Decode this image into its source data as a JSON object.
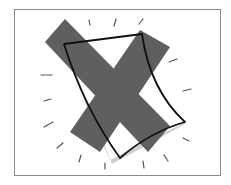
{
  "illustration": {
    "subject": "delete-document",
    "description": "Gray X mark over a curled sheet of paper with radiating tick marks",
    "colors": {
      "frame_border": "#8a8a8a",
      "x_mark": "#5f5f5f",
      "paper_outline": "#111111",
      "paper_fill": "#ffffff",
      "paper_shadow": "#cfcfcf",
      "ticks": "#555555"
    }
  }
}
